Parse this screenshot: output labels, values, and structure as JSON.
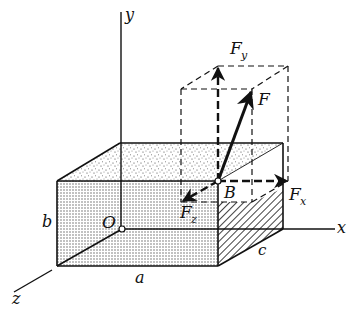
{
  "diagram": {
    "type": "3D force decomposition on rectangular box",
    "axes": {
      "x_label": "x",
      "y_label": "y",
      "z_label": "z",
      "origin_label": "O"
    },
    "dimensions": {
      "a": "a",
      "b": "b",
      "c": "c"
    },
    "point": {
      "label": "B"
    },
    "forces": {
      "resultant": "F",
      "fx": "F",
      "fx_sub": "x",
      "fy": "F",
      "fy_sub": "y",
      "fz": "F",
      "fz_sub": "z"
    },
    "colors": {
      "line": "#111111",
      "fill_stipple": "#d8d8d8",
      "background": "#ffffff"
    }
  }
}
